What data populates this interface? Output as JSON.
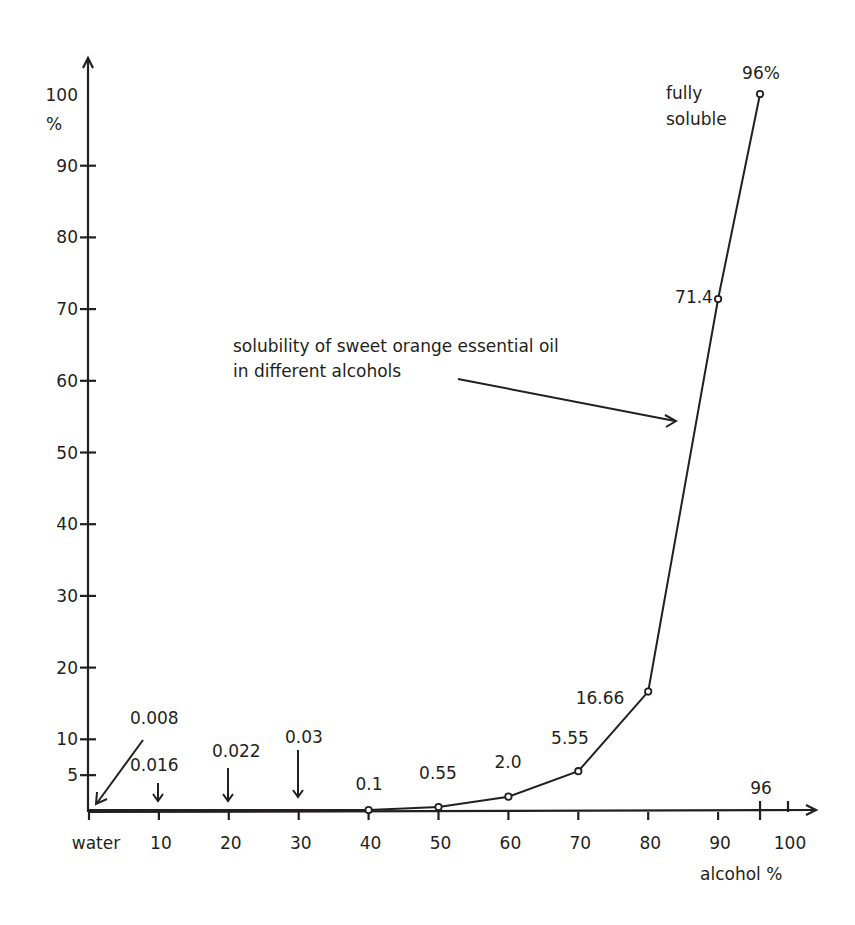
{
  "chart_data": {
    "type": "line",
    "title": "solubility of sweet orange essential oil in different alcohols",
    "xlabel": "alcohol %",
    "ylabel": "%",
    "x_tick_labels": [
      "water",
      "10",
      "20",
      "30",
      "40",
      "50",
      "60",
      "70",
      "80",
      "90",
      "100"
    ],
    "x_extra_tick_label": "96",
    "y_tick_labels": [
      "5",
      "10",
      "20",
      "30",
      "40",
      "50",
      "60",
      "70",
      "80",
      "90",
      "100"
    ],
    "xlim": [
      0,
      100
    ],
    "ylim": [
      0,
      100
    ],
    "grid": false,
    "legend": "none",
    "series": [
      {
        "name": "solubility of sweet orange essential oil in different alcohols",
        "x": [
          0,
          10,
          20,
          30,
          40,
          50,
          60,
          70,
          80,
          90,
          96
        ],
        "values": [
          0.008,
          0.016,
          0.022,
          0.03,
          0.1,
          0.55,
          2.0,
          5.55,
          16.66,
          71.4,
          100
        ],
        "point_labels": [
          "0.008",
          "0.016",
          "0.022",
          "0.03",
          "0.1",
          "0.55",
          "2.0",
          "5.55",
          "16.66",
          "71.4",
          "96%"
        ]
      }
    ],
    "annotations": [
      {
        "text": "fully",
        "near": "96%"
      },
      {
        "text": "soluble",
        "near": "96%"
      },
      {
        "text": "solubility of sweet orange essential oil",
        "line": 1
      },
      {
        "text": "in different alcohols",
        "line": 2
      }
    ]
  },
  "labels": {
    "y_unit": "%",
    "x_title": "alcohol %",
    "annotation_line1": "solubility of sweet orange essential oil",
    "annotation_line2": "in different alcohols",
    "fully": "fully",
    "soluble": "soluble"
  }
}
